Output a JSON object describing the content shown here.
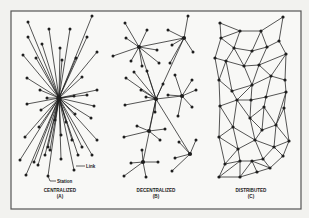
{
  "figure": {
    "frame": {
      "x": 11,
      "y": 11,
      "width": 290,
      "height": 198
    },
    "colors": {
      "ink": "#1e1e1e",
      "paper": "#f7f7f5",
      "frame": "#555555"
    },
    "panels": [
      {
        "id": "A",
        "title": "CENTRALIZED",
        "letter": "(A)",
        "annotations": [
          {
            "text": "Link",
            "x": 86,
            "y": 166
          },
          {
            "text": "Station",
            "x": 58,
            "y": 182
          }
        ]
      },
      {
        "id": "B",
        "title": "DECENTRALIZED",
        "letter": "(B)"
      },
      {
        "id": "C",
        "title": "DISTRIBUTED",
        "letter": "(C)"
      }
    ]
  },
  "centralized": {
    "hub": [
      59,
      98
    ],
    "nodes": [
      [
        28,
        22
      ],
      [
        49,
        29
      ],
      [
        70,
        29
      ],
      [
        92,
        16
      ],
      [
        28,
        37
      ],
      [
        42,
        44
      ],
      [
        60,
        48
      ],
      [
        87,
        37
      ],
      [
        23,
        55
      ],
      [
        36,
        58
      ],
      [
        62,
        60
      ],
      [
        76,
        58
      ],
      [
        97,
        52
      ],
      [
        27,
        78
      ],
      [
        40,
        90
      ],
      [
        47,
        98
      ],
      [
        74,
        96
      ],
      [
        87,
        95
      ],
      [
        97,
        90
      ],
      [
        94,
        106
      ],
      [
        27,
        104
      ],
      [
        75,
        114
      ],
      [
        91,
        118
      ],
      [
        39,
        127
      ],
      [
        25,
        137
      ],
      [
        48,
        147
      ],
      [
        61,
        135
      ],
      [
        72,
        140
      ],
      [
        97,
        140
      ],
      [
        82,
        147
      ],
      [
        34,
        162
      ],
      [
        45,
        155
      ],
      [
        50,
        150
      ],
      [
        61,
        159
      ],
      [
        78,
        155
      ],
      [
        92,
        155
      ],
      [
        74,
        170
      ],
      [
        26,
        175
      ],
      [
        48,
        176
      ],
      [
        38,
        165
      ],
      [
        55,
        120
      ],
      [
        66,
        122
      ],
      [
        41,
        110
      ],
      [
        82,
        77
      ],
      [
        20,
        160
      ]
    ]
  },
  "decentralized": {
    "hubs": [
      {
        "c": [
          139,
          47
        ],
        "leaves": [
          [
            125,
            23
          ],
          [
            147,
            30
          ],
          [
            126,
            38
          ],
          [
            113,
            56
          ],
          [
            131,
            61
          ],
          [
            157,
            50
          ],
          [
            142,
            66
          ],
          [
            159,
            63
          ]
        ]
      },
      {
        "c": [
          184,
          38
        ],
        "leaves": [
          [
            188,
            16
          ],
          [
            168,
            30
          ],
          [
            172,
            45
          ],
          [
            193,
            52
          ],
          [
            170,
            63
          ]
        ]
      },
      {
        "c": [
          156,
          99
        ],
        "leaves": [
          [
            126,
            78
          ],
          [
            134,
            72
          ],
          [
            125,
            105
          ],
          [
            141,
            90
          ],
          [
            147,
            71
          ],
          [
            163,
            84
          ],
          [
            155,
            112
          ],
          [
            146,
            97
          ]
        ]
      },
      {
        "c": [
          182,
          96
        ],
        "leaves": [
          [
            175,
            75
          ],
          [
            192,
            80
          ],
          [
            196,
            90
          ],
          [
            192,
            107
          ],
          [
            178,
            116
          ],
          [
            168,
            95
          ]
        ]
      },
      {
        "c": [
          149,
          131
        ],
        "leaves": [
          [
            137,
            126
          ],
          [
            124,
            137
          ],
          [
            165,
            129
          ],
          [
            160,
            140
          ]
        ]
      },
      {
        "c": [
          190,
          154
        ],
        "leaves": [
          [
            179,
            142
          ],
          [
            196,
            140
          ],
          [
            175,
            158
          ],
          [
            172,
            171
          ]
        ]
      },
      {
        "c": [
          143,
          162
        ],
        "leaves": [
          [
            142,
            150
          ],
          [
            131,
            163
          ],
          [
            158,
            162
          ],
          [
            124,
            176
          ],
          [
            146,
            177
          ]
        ]
      }
    ],
    "links": [
      [
        [
          139,
          47
        ],
        [
          184,
          38
        ]
      ],
      [
        [
          139,
          47
        ],
        [
          156,
          99
        ]
      ],
      [
        [
          184,
          38
        ],
        [
          156,
          99
        ]
      ],
      [
        [
          156,
          99
        ],
        [
          182,
          96
        ]
      ],
      [
        [
          156,
          99
        ],
        [
          149,
          131
        ]
      ],
      [
        [
          156,
          99
        ],
        [
          190,
          154
        ]
      ],
      [
        [
          156,
          99
        ],
        [
          143,
          162
        ]
      ]
    ]
  },
  "distributed": {
    "nodes": [
      [
        220,
        23
      ],
      [
        240,
        31
      ],
      [
        261,
        31
      ],
      [
        283,
        17
      ],
      [
        221,
        38
      ],
      [
        234,
        48
      ],
      [
        252,
        51
      ],
      [
        267,
        47
      ],
      [
        279,
        41
      ],
      [
        215,
        58
      ],
      [
        226,
        61
      ],
      [
        244,
        66
      ],
      [
        259,
        65
      ],
      [
        286,
        54
      ],
      [
        219,
        80
      ],
      [
        232,
        91
      ],
      [
        252,
        85
      ],
      [
        271,
        76
      ],
      [
        285,
        80
      ],
      [
        237,
        100
      ],
      [
        251,
        100
      ],
      [
        266,
        97
      ],
      [
        286,
        92
      ],
      [
        220,
        106
      ],
      [
        264,
        107
      ],
      [
        284,
        108
      ],
      [
        233,
        127
      ],
      [
        250,
        118
      ],
      [
        262,
        130
      ],
      [
        276,
        125
      ],
      [
        219,
        137
      ],
      [
        255,
        140
      ],
      [
        274,
        147
      ],
      [
        289,
        141
      ],
      [
        238,
        149
      ],
      [
        283,
        156
      ],
      [
        263,
        159
      ],
      [
        225,
        164
      ],
      [
        240,
        161
      ],
      [
        252,
        161
      ],
      [
        270,
        168
      ],
      [
        219,
        177
      ],
      [
        240,
        177
      ],
      [
        257,
        172
      ]
    ],
    "edges": [
      [
        0,
        1
      ],
      [
        1,
        2
      ],
      [
        2,
        3
      ],
      [
        0,
        4
      ],
      [
        1,
        5
      ],
      [
        1,
        4
      ],
      [
        2,
        6
      ],
      [
        2,
        7
      ],
      [
        3,
        8
      ],
      [
        4,
        5
      ],
      [
        5,
        6
      ],
      [
        6,
        7
      ],
      [
        7,
        8
      ],
      [
        4,
        9
      ],
      [
        5,
        10
      ],
      [
        5,
        11
      ],
      [
        6,
        11
      ],
      [
        7,
        12
      ],
      [
        8,
        13
      ],
      [
        12,
        13
      ],
      [
        9,
        10
      ],
      [
        10,
        11
      ],
      [
        11,
        12
      ],
      [
        9,
        14
      ],
      [
        10,
        14
      ],
      [
        10,
        15
      ],
      [
        11,
        16
      ],
      [
        12,
        16
      ],
      [
        12,
        17
      ],
      [
        13,
        17
      ],
      [
        13,
        18
      ],
      [
        14,
        15
      ],
      [
        15,
        16
      ],
      [
        16,
        17
      ],
      [
        17,
        18
      ],
      [
        14,
        23
      ],
      [
        15,
        19
      ],
      [
        16,
        19
      ],
      [
        16,
        20
      ],
      [
        17,
        21
      ],
      [
        18,
        22
      ],
      [
        19,
        20
      ],
      [
        20,
        21
      ],
      [
        21,
        22
      ],
      [
        22,
        25
      ],
      [
        23,
        19
      ],
      [
        23,
        26
      ],
      [
        19,
        26
      ],
      [
        19,
        27
      ],
      [
        20,
        27
      ],
      [
        21,
        24
      ],
      [
        24,
        27
      ],
      [
        24,
        28
      ],
      [
        24,
        29
      ],
      [
        22,
        29
      ],
      [
        25,
        29
      ],
      [
        27,
        28
      ],
      [
        28,
        29
      ],
      [
        23,
        30
      ],
      [
        26,
        30
      ],
      [
        26,
        31
      ],
      [
        27,
        31
      ],
      [
        28,
        31
      ],
      [
        29,
        32
      ],
      [
        29,
        33
      ],
      [
        25,
        33
      ],
      [
        31,
        32
      ],
      [
        32,
        33
      ],
      [
        30,
        34
      ],
      [
        26,
        34
      ],
      [
        31,
        34
      ],
      [
        31,
        36
      ],
      [
        32,
        36
      ],
      [
        32,
        35
      ],
      [
        33,
        35
      ],
      [
        34,
        38
      ],
      [
        34,
        37
      ],
      [
        30,
        37
      ],
      [
        36,
        39
      ],
      [
        36,
        40
      ],
      [
        35,
        40
      ],
      [
        38,
        39
      ],
      [
        37,
        38
      ],
      [
        39,
        40
      ],
      [
        37,
        41
      ],
      [
        38,
        41
      ],
      [
        38,
        42
      ],
      [
        39,
        42
      ],
      [
        39,
        43
      ],
      [
        40,
        43
      ],
      [
        41,
        42
      ],
      [
        42,
        43
      ]
    ]
  }
}
